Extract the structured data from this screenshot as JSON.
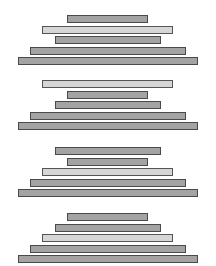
{
  "diagram": {
    "colors": {
      "bar": "#a3a3a3",
      "highlight": "#d6d6d6",
      "border": "#4a4a4a",
      "background": "#ffffff"
    },
    "bar_sizes": {
      "A": {
        "x": 67,
        "width": 81
      },
      "B": {
        "x": 55,
        "width": 106
      },
      "C": {
        "x": 42,
        "width": 131
      },
      "D": {
        "x": 30,
        "width": 156
      },
      "E": {
        "x": 18,
        "width": 180
      }
    },
    "groups": [
      {
        "top": 15,
        "order": [
          "A",
          "C",
          "B",
          "D",
          "E"
        ],
        "highlight": "C"
      },
      {
        "top": 80,
        "order": [
          "C",
          "A",
          "B",
          "D",
          "E"
        ],
        "highlight": "C"
      },
      {
        "top": 147,
        "order": [
          "B",
          "A",
          "C",
          "D",
          "E"
        ],
        "highlight": "C"
      },
      {
        "top": 213,
        "order": [
          "A",
          "B",
          "C",
          "D",
          "E"
        ],
        "highlight": "C"
      }
    ]
  }
}
